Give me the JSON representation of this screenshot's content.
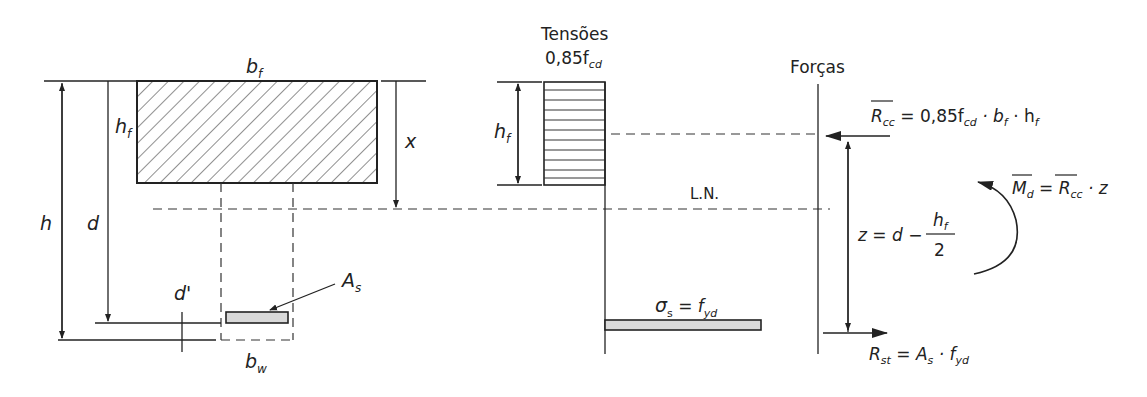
{
  "section": {
    "b_f": {
      "main": "b",
      "sub": "f"
    },
    "h_f": {
      "main": "h",
      "sub": "f"
    },
    "h": "h",
    "d": "d",
    "x": "x",
    "d_prime": "d'",
    "A_s": {
      "main": "A",
      "sub": "s"
    },
    "b_w": {
      "main": "b",
      "sub": "w"
    }
  },
  "stresses": {
    "title": "Tensões",
    "concrete_stress": {
      "main": "0,85f",
      "sub": "cd"
    },
    "h_f": {
      "main": "h",
      "sub": "f"
    },
    "neutral_axis": "L.N.",
    "steel_stress": {
      "sigma": "σ",
      "sigma_sub": "s",
      "eq": " = f",
      "sub": "yd"
    }
  },
  "forces": {
    "title": "Forças",
    "Rcc": {
      "main": "R",
      "sub": "cc",
      "eq": " = 0,85f",
      "eq_sub": "cd",
      "rest1": " · b",
      "rest1_sub": "f",
      "rest2": " · h",
      "rest2_sub": "f"
    },
    "z": {
      "lhs": "z = d −",
      "num_main": "h",
      "num_sub": "f",
      "den": "2"
    },
    "Md": {
      "main": "M",
      "sub": "d",
      "eq": " = ",
      "R": "R",
      "R_sub": "cc",
      "rest": " · z"
    },
    "Rst": {
      "main": "R",
      "sub": "st",
      "eq": " = A",
      "eq_sub": "s",
      "rest": " · f",
      "rest_sub": "yd"
    }
  },
  "colors": {
    "line": "#222222",
    "steel_fill": "#d9d9d9"
  }
}
